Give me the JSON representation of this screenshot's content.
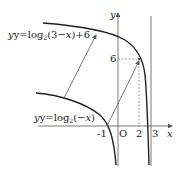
{
  "diagram": {
    "type": "function-graph",
    "axes": {
      "x_label": "x",
      "y_label": "y",
      "origin_label": "O",
      "x_ticks": [
        "-1",
        "2",
        "3"
      ],
      "y_ticks": [
        "6"
      ]
    },
    "curves": [
      {
        "name": "upper",
        "label_prefix": "y=log",
        "label_base": "2",
        "label_arg": "(3−",
        "label_var": "x",
        "label_suffix": ")+6"
      },
      {
        "name": "lower",
        "label_prefix": "y=log",
        "label_base": "2",
        "label_arg": "(−",
        "label_var": "x",
        "label_suffix": ")"
      }
    ],
    "asymptote": "x=3",
    "highlighted_point": {
      "x": 2,
      "y": 6
    },
    "translation_arrows": 3,
    "colors": {
      "curve": "#222222",
      "axis": "#555555",
      "arrow": "#555555",
      "dashed": "#777777"
    }
  }
}
